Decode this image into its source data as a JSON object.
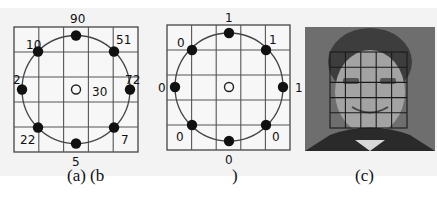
{
  "figure": {
    "panels": [
      {
        "id": "a",
        "caption": "(a) (b",
        "center_marker": "open-circle",
        "center_value": "30",
        "neighbors": [
          {
            "position": "top",
            "value": "90"
          },
          {
            "position": "top-right",
            "value": "51"
          },
          {
            "position": "right",
            "value": "72"
          },
          {
            "position": "bottom-right",
            "value": "7"
          },
          {
            "position": "bottom",
            "value": "5"
          },
          {
            "position": "bottom-left",
            "value": "22"
          },
          {
            "position": "left",
            "value": "2"
          },
          {
            "position": "top-left",
            "value": "10"
          }
        ]
      },
      {
        "id": "b",
        "caption": ")",
        "center_marker": "open-circle",
        "neighbors": [
          {
            "position": "top",
            "value": "1"
          },
          {
            "position": "top-right",
            "value": "1"
          },
          {
            "position": "right",
            "value": "1"
          },
          {
            "position": "bottom-right",
            "value": "0"
          },
          {
            "position": "bottom",
            "value": "0"
          },
          {
            "position": "bottom-left",
            "value": "0"
          },
          {
            "position": "left",
            "value": "0"
          },
          {
            "position": "top-left",
            "value": "0"
          }
        ]
      },
      {
        "id": "c",
        "caption": "(c)",
        "image": "face-photo-with-5x5-grid"
      }
    ],
    "grid": {
      "rows": 5,
      "cols": 5
    },
    "colors": {
      "background": "#f3f3f3",
      "grid_line": "#444444",
      "dot": "#111111",
      "photo_bg": "#6e6e6e"
    }
  }
}
